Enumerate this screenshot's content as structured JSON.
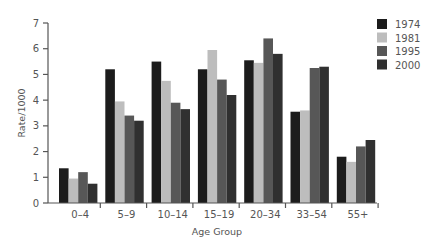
{
  "chart_data": {
    "type": "bar",
    "title": "",
    "xlabel": "Age Group",
    "ylabel": "Rate/1000",
    "ylim": [
      0,
      7
    ],
    "yticks": [
      0,
      1,
      2,
      3,
      4,
      5,
      6,
      7
    ],
    "grid": false,
    "legend_position": "top-right",
    "categories": [
      "0–4",
      "5–9",
      "10–14",
      "15–19",
      "20–34",
      "33–54",
      "55+"
    ],
    "series": [
      {
        "name": "1974",
        "color": "#1c1c1c",
        "values": [
          1.35,
          5.2,
          5.5,
          5.2,
          5.55,
          3.55,
          1.8
        ]
      },
      {
        "name": "1981",
        "color": "#bdbdbd",
        "values": [
          0.95,
          3.95,
          4.75,
          5.95,
          5.45,
          3.6,
          1.6
        ]
      },
      {
        "name": "1995",
        "color": "#575757",
        "values": [
          1.2,
          3.4,
          3.9,
          4.8,
          6.4,
          5.25,
          2.2
        ]
      },
      {
        "name": "2000",
        "color": "#303030",
        "values": [
          0.75,
          3.2,
          3.65,
          4.2,
          5.8,
          5.3,
          2.45
        ]
      }
    ]
  }
}
